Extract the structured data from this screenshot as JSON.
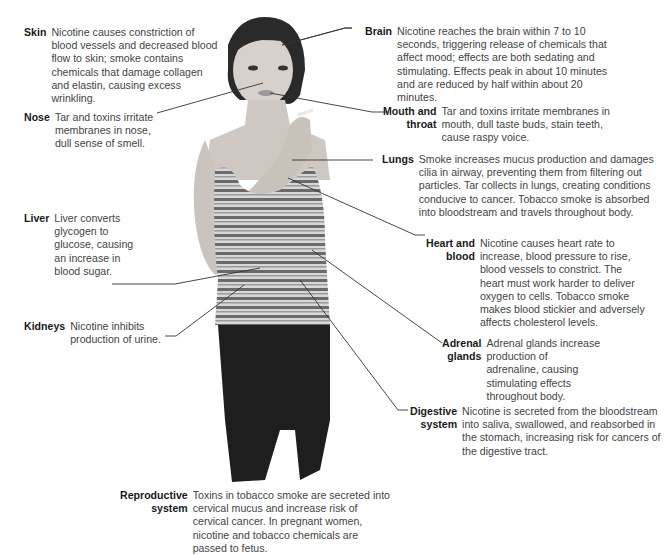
{
  "diagram": {
    "figure_description": "Young woman holding a cigarette, wearing a striped tank top and dark jeans",
    "colors": {
      "text": "#444444",
      "term": "#1a1a1a",
      "line": "#333333",
      "background": "#ffffff"
    },
    "callouts": [
      {
        "id": "skin",
        "term": "Skin",
        "text": "Nicotine causes constriction of blood vessels and decreased blood flow to skin; smoke contains chemicals that damage collagen and elastin, causing excess wrinkling."
      },
      {
        "id": "nose",
        "term": "Nose",
        "text": "Tar and toxins irritate membranes in nose, dull sense of smell."
      },
      {
        "id": "liver",
        "term": "Liver",
        "text": "Liver converts glycogen to glucose, causing an increase in blood sugar."
      },
      {
        "id": "kidneys",
        "term": "Kidneys",
        "text": "Nicotine inhibits production of urine."
      },
      {
        "id": "brain",
        "term": "Brain",
        "text": "Nicotine reaches the brain within 7 to 10 seconds, triggering release of chemicals that affect mood; effects are both sedating and stimulating. Effects peak in about 10 minutes and are reduced by half within about 20 minutes."
      },
      {
        "id": "mouth",
        "term": "Mouth and\nthroat",
        "text": "Tar and toxins irritate membranes in mouth, dull taste buds, stain teeth, cause raspy voice."
      },
      {
        "id": "lungs",
        "term": "Lungs",
        "text": "Smoke increases mucus production and damages cilia in airway, preventing them from filtering out particles. Tar collects in lungs, creating conditions conducive to cancer. Tobacco smoke is absorbed into bloodstream and travels throughout body."
      },
      {
        "id": "heart",
        "term": "Heart and\nblood",
        "text": "Nicotine causes heart rate to increase, blood pressure to rise, blood vessels to constrict. The heart must work harder to deliver oxygen to cells. Tobacco smoke makes blood stickier and adversely affects cholesterol levels."
      },
      {
        "id": "adrenal",
        "term": "Adrenal\nglands",
        "text": "Adrenal glands increase production of adrenaline, causing stimulating effects throughout body."
      },
      {
        "id": "digestive",
        "term": "Digestive\nsystem",
        "text": "Nicotine is secreted from the bloodstream into saliva, swallowed, and reabsorbed in the stomach, increasing risk for cancers of the digestive tract."
      },
      {
        "id": "reproductive",
        "term": "Reproductive\nsystem",
        "text": "Toxins in tobacco smoke are secreted into cervical mucus and increase risk of cervical cancer. In pregnant women, nicotine and tobacco chemicals are passed to fetus."
      }
    ]
  }
}
